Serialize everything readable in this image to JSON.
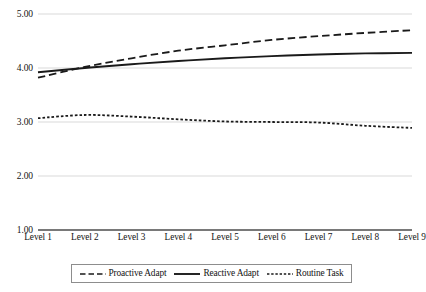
{
  "chart_data": {
    "type": "line",
    "title": "",
    "subtitle": "",
    "xlabel": "",
    "ylabel": "",
    "grid": true,
    "gridlines_horizontal_only": true,
    "legend_position": "bottom",
    "ylim": [
      1.0,
      5.0
    ],
    "ytick_step": 1.0,
    "ytick_labels": [
      "5.00",
      "4.00",
      "3.00",
      "2.00",
      "1.00"
    ],
    "ytick_values": [
      5.0,
      4.0,
      3.0,
      2.0,
      1.0
    ],
    "categories": [
      "Level 1",
      "Level 2",
      "Level 3",
      "Level 4",
      "Level 5",
      "Level 6",
      "Level 7",
      "Level 8",
      "Level 9"
    ],
    "series": [
      {
        "name": "Proactive Adapt",
        "style": "long-dash",
        "color": "#1a1a1a",
        "values": [
          3.82,
          4.02,
          4.18,
          4.32,
          4.42,
          4.52,
          4.59,
          4.65,
          4.7
        ]
      },
      {
        "name": "Reactive Adapt",
        "style": "solid",
        "color": "#1a1a1a",
        "values": [
          3.92,
          4.0,
          4.07,
          4.13,
          4.18,
          4.22,
          4.25,
          4.27,
          4.28
        ]
      },
      {
        "name": "Routine Task",
        "style": "short-dash",
        "color": "#1a1a1a",
        "values": [
          3.07,
          3.13,
          3.1,
          3.05,
          3.01,
          3.0,
          2.99,
          2.93,
          2.89
        ]
      }
    ]
  },
  "legend": {
    "items": [
      {
        "label": "Proactive Adapt",
        "swatch": "long-dash-line-icon"
      },
      {
        "label": "Reactive Adapt",
        "swatch": "solid-line-icon"
      },
      {
        "label": "Routine Task",
        "swatch": "short-dash-line-icon"
      }
    ]
  },
  "style": {
    "gridline_color": "#d9d9d9",
    "axis_color": "#4d4d4d",
    "series_color": "#1a1a1a",
    "legend_border_color": "#8d8d8d",
    "background": "#ffffff"
  },
  "geometry": {
    "plot_left": 38,
    "plot_right": 412,
    "plot_top": 14,
    "plot_bottom": 230
  }
}
